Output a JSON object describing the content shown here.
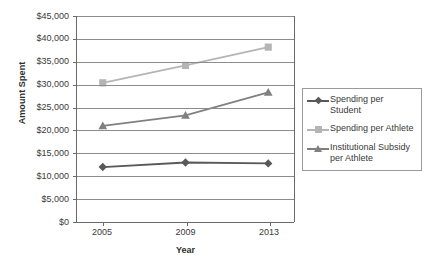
{
  "chart_data": {
    "type": "line",
    "title": "",
    "xlabel": "Year",
    "ylabel": "Amount Spent",
    "categories": [
      "2005",
      "2009",
      "2013"
    ],
    "x": [
      2005,
      2009,
      2013
    ],
    "ylim": [
      0,
      45000
    ],
    "ytick_step": 5000,
    "ytick_labels": [
      "$0",
      "$5,000",
      "$10,000",
      "$15,000",
      "$20,000",
      "$25,000",
      "$30,000",
      "$35,000",
      "$40,000",
      "$45,000"
    ],
    "ytick_values": [
      0,
      5000,
      10000,
      15000,
      20000,
      25000,
      30000,
      35000,
      40000,
      45000
    ],
    "grid": true,
    "grid_axis": "y",
    "legend_position": "right",
    "series": [
      {
        "name": "Spending per Student",
        "values": [
          12000,
          13000,
          12800
        ],
        "color": "#595959",
        "marker": "diamond"
      },
      {
        "name": "Spending per Athlete",
        "values": [
          30400,
          34200,
          38200
        ],
        "color": "#b5b5b5",
        "marker": "square"
      },
      {
        "name": "Institutional Subsidy per Athlete",
        "values": [
          21000,
          23300,
          28300
        ],
        "color": "#808080",
        "marker": "triangle"
      }
    ]
  },
  "legend": {
    "items": [
      {
        "label": "Spending per Student"
      },
      {
        "label": "Spending per Athlete"
      },
      {
        "label": "Institutional Subsidy per Athlete"
      }
    ]
  },
  "colors": {
    "series_student": "#595959",
    "series_athlete": "#b5b5b5",
    "series_subsidy": "#808080",
    "gridline": "#8c8c8c",
    "axis": "#6a6a6a",
    "text": "#3a3a3a",
    "background": "#ffffff"
  }
}
